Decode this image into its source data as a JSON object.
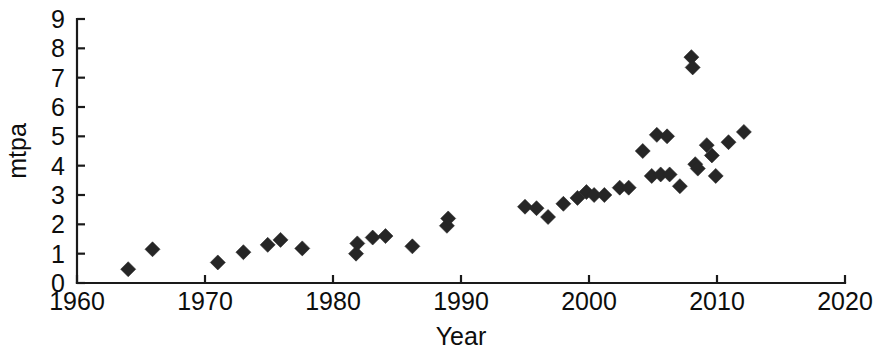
{
  "chart_data": {
    "type": "scatter",
    "title": "",
    "xlabel": "Year",
    "ylabel": "mtpa",
    "xlim": [
      1960,
      2020
    ],
    "ylim": [
      0,
      9
    ],
    "xticks": [
      1960,
      1970,
      1980,
      1990,
      2000,
      2010,
      2020
    ],
    "xtick_labels": [
      "1960",
      "1970",
      "1980",
      "1990",
      "2000",
      "2010",
      "2020"
    ],
    "yticks": [
      0,
      1,
      2,
      3,
      4,
      5,
      6,
      7,
      8,
      9
    ],
    "ytick_labels": [
      "0",
      "1",
      "2",
      "3",
      "4",
      "5",
      "6",
      "7",
      "8",
      "9"
    ],
    "grid": false,
    "legend": null,
    "marker": "diamond",
    "marker_color": "#262626",
    "marker_size": 15,
    "points": [
      {
        "x": 1964.0,
        "y": 0.47
      },
      {
        "x": 1965.9,
        "y": 1.15
      },
      {
        "x": 1971.0,
        "y": 0.7
      },
      {
        "x": 1973.0,
        "y": 1.05
      },
      {
        "x": 1974.9,
        "y": 1.3
      },
      {
        "x": 1975.9,
        "y": 1.47
      },
      {
        "x": 1977.6,
        "y": 1.18
      },
      {
        "x": 1981.8,
        "y": 1.0
      },
      {
        "x": 1981.9,
        "y": 1.35
      },
      {
        "x": 1983.1,
        "y": 1.55
      },
      {
        "x": 1984.1,
        "y": 1.6
      },
      {
        "x": 1986.2,
        "y": 1.25
      },
      {
        "x": 1988.9,
        "y": 1.95
      },
      {
        "x": 1989.0,
        "y": 2.2
      },
      {
        "x": 1995.0,
        "y": 2.6
      },
      {
        "x": 1995.9,
        "y": 2.55
      },
      {
        "x": 1996.8,
        "y": 2.25
      },
      {
        "x": 1998.0,
        "y": 2.7
      },
      {
        "x": 1999.1,
        "y": 2.9
      },
      {
        "x": 1999.8,
        "y": 3.1
      },
      {
        "x": 2000.4,
        "y": 3.0
      },
      {
        "x": 2001.2,
        "y": 3.0
      },
      {
        "x": 2002.4,
        "y": 3.25
      },
      {
        "x": 2003.1,
        "y": 3.25
      },
      {
        "x": 2004.2,
        "y": 4.5
      },
      {
        "x": 2004.9,
        "y": 3.65
      },
      {
        "x": 2005.3,
        "y": 5.05
      },
      {
        "x": 2005.6,
        "y": 3.7
      },
      {
        "x": 2006.1,
        "y": 5.0
      },
      {
        "x": 2006.3,
        "y": 3.7
      },
      {
        "x": 2007.1,
        "y": 3.3
      },
      {
        "x": 2008.0,
        "y": 7.7
      },
      {
        "x": 2008.1,
        "y": 7.35
      },
      {
        "x": 2008.3,
        "y": 4.05
      },
      {
        "x": 2008.5,
        "y": 3.9
      },
      {
        "x": 2009.2,
        "y": 4.7
      },
      {
        "x": 2009.6,
        "y": 4.35
      },
      {
        "x": 2009.9,
        "y": 3.65
      },
      {
        "x": 2010.9,
        "y": 4.8
      },
      {
        "x": 2012.1,
        "y": 5.15
      }
    ]
  },
  "axes_geometry": {
    "x_pixel_min": 77,
    "x_pixel_max": 845,
    "y_pixel_min": 283,
    "y_pixel_max": 19
  }
}
